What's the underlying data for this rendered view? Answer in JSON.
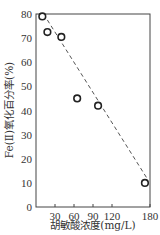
{
  "chart_data": {
    "type": "scatter",
    "title": "",
    "xlabel": "胡敏酸浓度(mg/L)",
    "ylabel": "Fe(Ⅱ)氧化百分率(%)",
    "xlim": [
      0,
      180
    ],
    "ylim": [
      0,
      80
    ],
    "x_ticks": [
      30,
      60,
      90,
      120,
      180
    ],
    "x_tick_labels": [
      "30",
      "60",
      "90",
      "120",
      "180"
    ],
    "y_ticks": [
      0,
      10,
      20,
      30,
      40,
      50,
      60,
      70,
      80
    ],
    "y_tick_labels": [
      "0",
      "10",
      "20",
      "30",
      "40",
      "50",
      "60",
      "70",
      "80"
    ],
    "grid": false,
    "legend": null,
    "series": [
      {
        "name": "observed",
        "marker": "open-circle",
        "x": [
          10,
          18,
          40,
          65,
          98,
          172
        ],
        "y": [
          79,
          72.5,
          70.5,
          45,
          42,
          10
        ]
      }
    ],
    "trendline": {
      "style": "dashed",
      "x": [
        12,
        175
      ],
      "y": [
        80,
        12
      ]
    }
  },
  "labels": {
    "xlabel": "胡敏酸浓度(mg/L)",
    "ylabel": "Fe(Ⅱ)氧化百分率(%)"
  }
}
